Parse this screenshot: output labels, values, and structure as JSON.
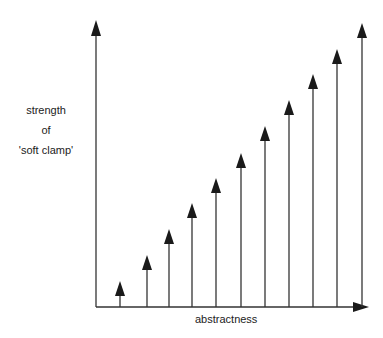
{
  "diagram": {
    "y_axis_label_lines": [
      "strength",
      "of",
      "'soft clamp'"
    ],
    "x_axis_label": "abstractness",
    "colors": {
      "line": "#333333",
      "arrowhead": "#1a1a1a",
      "text": "#222222"
    }
  },
  "chart_data": {
    "type": "bar",
    "title": "",
    "xlabel": "abstractness",
    "ylabel": "strength of 'soft clamp'",
    "categories": [
      1,
      2,
      3,
      4,
      5,
      6,
      7,
      8,
      9,
      10,
      11
    ],
    "values": [
      1,
      2,
      3,
      4,
      5,
      6,
      7,
      8,
      9,
      10,
      11
    ],
    "arrows_px": [
      {
        "x": 120,
        "tip": 281
      },
      {
        "x": 147,
        "tip": 255
      },
      {
        "x": 169,
        "tip": 229
      },
      {
        "x": 192,
        "tip": 203
      },
      {
        "x": 216,
        "tip": 178
      },
      {
        "x": 241,
        "tip": 153
      },
      {
        "x": 265,
        "tip": 126
      },
      {
        "x": 289,
        "tip": 100
      },
      {
        "x": 313,
        "tip": 74
      },
      {
        "x": 337,
        "tip": 49
      },
      {
        "x": 362,
        "tip": 23
      }
    ],
    "grid": false
  }
}
